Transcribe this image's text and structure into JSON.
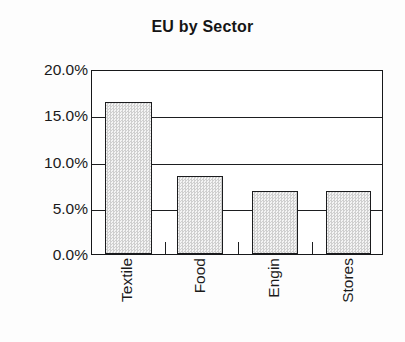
{
  "chart_data": {
    "type": "bar",
    "title": "EU by Sector",
    "xlabel": "",
    "ylabel": "",
    "categories": [
      "Textile",
      "Food",
      "Engin",
      "Stores"
    ],
    "values": [
      16.6,
      8.5,
      6.9,
      6.9
    ],
    "value_labels": [
      "16.6%",
      "8.5%",
      "6.9%",
      "6.9%"
    ],
    "ylim": [
      0,
      20
    ],
    "ytick_values": [
      0,
      5,
      10,
      15,
      20
    ],
    "ytick_labels": [
      "0.0%",
      "5.0%",
      "10.0%",
      "15.0%",
      "20.0%"
    ],
    "grid": true,
    "grid_axis": "y",
    "legend": false,
    "legend_position": "none",
    "bar_fill_color": "#d8d8d8",
    "bar_edge_color": "#1b1c1e",
    "axis_color": "#17181a",
    "text_color": "#1a1a1a",
    "background_color": "#fdfdfd",
    "xtick_label_rotation": 90
  }
}
